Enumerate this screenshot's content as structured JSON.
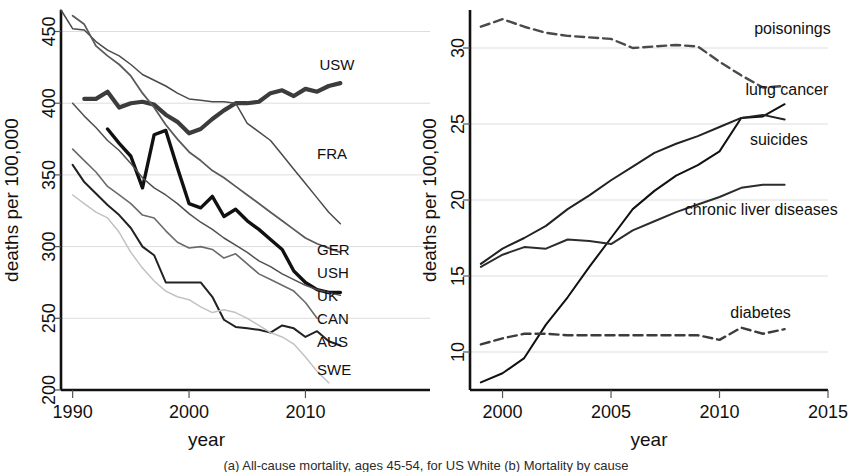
{
  "figure": {
    "caption_partial": "(a) All-cause mortality, ages 45-54, for US White (b) Mortality by cause"
  },
  "chart_data": [
    {
      "id": "left",
      "type": "line",
      "title": "",
      "xlabel": "year",
      "ylabel": "deaths per 100,000",
      "xlim": [
        1989,
        2014
      ],
      "ylim": [
        200,
        465
      ],
      "xticks": [
        1990,
        2000,
        2010
      ],
      "yticks": [
        200,
        250,
        300,
        350,
        400,
        450
      ],
      "grid": true,
      "legend_position": "right-inline",
      "series": [
        {
          "name": "USW",
          "label": "USW",
          "style": "solid",
          "weight": 4.2,
          "color": "#3c3c3c",
          "label_x": 2011.2,
          "label_y": 427,
          "x": [
            1991,
            1992,
            1993,
            1994,
            1995,
            1996,
            1997,
            1998,
            1999,
            2000,
            2001,
            2002,
            2003,
            2004,
            2005,
            2006,
            2007,
            2008,
            2009,
            2010,
            2011,
            2012,
            2013
          ],
          "y": [
            403,
            403,
            408,
            397,
            400,
            401,
            399,
            392,
            387,
            379,
            382,
            389,
            395,
            400,
            400,
            401,
            407,
            409,
            405,
            410,
            408,
            412,
            414
          ]
        },
        {
          "name": "FRA",
          "label": "FRA",
          "style": "solid",
          "weight": 1.5,
          "color": "#4a4a4a",
          "label_x": 2011.0,
          "label_y": 365,
          "x": [
            1989,
            1990,
            1991,
            1992,
            1993,
            1994,
            1995,
            1996,
            1997,
            1998,
            1999,
            2000,
            2001,
            2002,
            2003,
            2004,
            2005,
            2006,
            2007,
            2008,
            2009,
            2010,
            2011,
            2012,
            2013
          ],
          "y": [
            465,
            452,
            451,
            443,
            437,
            433,
            427,
            420,
            416,
            412,
            407,
            403,
            402,
            401,
            401,
            400,
            386,
            380,
            374,
            364,
            354,
            344,
            334,
            324,
            316
          ]
        },
        {
          "name": "GER",
          "label": "GER",
          "style": "solid",
          "weight": 1.8,
          "color": "#5a5a5a",
          "label_x": 2011.0,
          "label_y": 298,
          "x": [
            1990,
            1991,
            1992,
            1993,
            1994,
            1995,
            1996,
            1997,
            1998,
            1999,
            2000,
            2001,
            2002,
            2003,
            2004,
            2005,
            2006,
            2007,
            2008,
            2009,
            2010,
            2011,
            2012,
            2013
          ],
          "y": [
            461,
            455,
            440,
            433,
            427,
            419,
            407,
            397,
            385,
            375,
            366,
            360,
            353,
            348,
            342,
            336,
            330,
            324,
            318,
            312,
            306,
            302,
            299,
            296
          ]
        },
        {
          "name": "USH",
          "label": "USH",
          "style": "solid",
          "weight": 3.4,
          "color": "#111111",
          "label_x": 2011.0,
          "label_y": 282,
          "x": [
            1993,
            1994,
            1995,
            1996,
            1997,
            1998,
            1999,
            2000,
            2001,
            2002,
            2003,
            2004,
            2005,
            2006,
            2007,
            2008,
            2009,
            2010,
            2011,
            2012,
            2013
          ],
          "y": [
            382,
            372,
            363,
            341,
            378,
            381,
            355,
            330,
            327,
            335,
            321,
            326,
            318,
            312,
            305,
            298,
            283,
            275,
            270,
            268,
            268
          ]
        },
        {
          "name": "UK",
          "label": "UK",
          "style": "solid",
          "weight": 1.5,
          "color": "#4f4f4f",
          "label_x": 2011.0,
          "label_y": 266,
          "x": [
            1990,
            1991,
            1992,
            1993,
            1994,
            1995,
            1996,
            1997,
            1998,
            1999,
            2000,
            2001,
            2002,
            2003,
            2004,
            2005,
            2006,
            2007,
            2008,
            2009,
            2010,
            2011,
            2012,
            2013
          ],
          "y": [
            400,
            391,
            383,
            374,
            367,
            358,
            348,
            341,
            336,
            330,
            323,
            317,
            312,
            306,
            301,
            296,
            290,
            286,
            281,
            277,
            273,
            270,
            268,
            266
          ]
        },
        {
          "name": "CAN",
          "label": "CAN",
          "style": "solid",
          "weight": 1.6,
          "color": "#6a6a6a",
          "label_x": 2011.0,
          "label_y": 250,
          "x": [
            1990,
            1991,
            1992,
            1993,
            1994,
            1995,
            1996,
            1997,
            1998,
            1999,
            2000,
            2001,
            2002,
            2003,
            2004,
            2005,
            2006,
            2007,
            2008,
            2009,
            2010,
            2011
          ],
          "y": [
            368,
            360,
            352,
            342,
            336,
            330,
            322,
            320,
            311,
            303,
            299,
            300,
            298,
            292,
            295,
            288,
            281,
            277,
            273,
            269,
            261,
            250
          ]
        },
        {
          "name": "AUS",
          "label": "AUS",
          "style": "solid",
          "weight": 2.0,
          "color": "#222222",
          "label_x": 2011.0,
          "label_y": 234,
          "x": [
            1990,
            1991,
            1992,
            1993,
            1994,
            1995,
            1996,
            1997,
            1998,
            1999,
            2000,
            2001,
            2002,
            2003,
            2004,
            2005,
            2006,
            2007,
            2008,
            2009,
            2010,
            2011,
            2012,
            2013
          ],
          "y": [
            357,
            345,
            337,
            329,
            322,
            313,
            300,
            294,
            275,
            275,
            275,
            275,
            265,
            249,
            244,
            243,
            242,
            240,
            245,
            243,
            237,
            241,
            234,
            231
          ]
        },
        {
          "name": "SWE",
          "label": "SWE",
          "style": "solid",
          "weight": 1.5,
          "color": "#c2c2c2",
          "label_x": 2011.0,
          "label_y": 214,
          "x": [
            1990,
            1991,
            1992,
            1993,
            1994,
            1995,
            1996,
            1997,
            1998,
            1999,
            2000,
            2001,
            2002,
            2003,
            2004,
            2005,
            2006,
            2007,
            2008,
            2009,
            2010,
            2011,
            2012
          ],
          "y": [
            336,
            330,
            324,
            320,
            310,
            296,
            285,
            276,
            269,
            265,
            263,
            258,
            254,
            256,
            254,
            250,
            245,
            240,
            237,
            232,
            223,
            213,
            205
          ]
        }
      ]
    },
    {
      "id": "right",
      "type": "line",
      "title": "",
      "xlabel": "year",
      "ylabel": "deaths per 100,000",
      "xlim": [
        1998.5,
        2015
      ],
      "ylim": [
        7.5,
        32.5
      ],
      "xticks": [
        2000,
        2005,
        2010,
        2015
      ],
      "yticks": [
        10,
        15,
        20,
        25,
        30
      ],
      "grid": true,
      "legend_position": "right-inline",
      "series": [
        {
          "name": "poisonings",
          "label": "poisonings",
          "style": "solid",
          "weight": 2.0,
          "color": "#111111",
          "label_x": 2011.6,
          "label_y": 31.3,
          "x": [
            1999,
            2000,
            2001,
            2002,
            2003,
            2004,
            2005,
            2006,
            2007,
            2008,
            2009,
            2010,
            2011,
            2012,
            2013
          ],
          "y": [
            8.0,
            8.6,
            9.6,
            11.8,
            13.6,
            15.6,
            17.5,
            19.4,
            20.6,
            21.6,
            22.3,
            23.2,
            25.4,
            25.5,
            26.3
          ]
        },
        {
          "name": "lung cancer",
          "label": "lung cancer",
          "style": "dashed",
          "weight": 2.4,
          "color": "#4a4a4a",
          "label_x": 2011.2,
          "label_y": 27.3,
          "x": [
            1999,
            2000,
            2001,
            2002,
            2003,
            2004,
            2005,
            2006,
            2007,
            2008,
            2009,
            2010,
            2011,
            2012,
            2013
          ],
          "y": [
            31.4,
            31.9,
            31.4,
            31.0,
            30.8,
            30.7,
            30.6,
            30.0,
            30.1,
            30.2,
            30.1,
            29.1,
            28.2,
            27.4,
            27.5
          ]
        },
        {
          "name": "suicides",
          "label": "suicides",
          "style": "solid",
          "weight": 2.0,
          "color": "#222222",
          "label_x": 2011.4,
          "label_y": 24.0,
          "x": [
            1999,
            2000,
            2001,
            2002,
            2003,
            2004,
            2005,
            2006,
            2007,
            2008,
            2009,
            2010,
            2011,
            2012,
            2013
          ],
          "y": [
            15.8,
            16.8,
            17.5,
            18.3,
            19.4,
            20.3,
            21.3,
            22.2,
            23.1,
            23.7,
            24.2,
            24.8,
            25.4,
            25.6,
            25.3
          ]
        },
        {
          "name": "chronic liver diseases",
          "label": "chronic liver diseases",
          "style": "solid",
          "weight": 2.0,
          "color": "#2c2c2c",
          "label_x": 2008.4,
          "label_y": 19.4,
          "x": [
            1999,
            2000,
            2001,
            2002,
            2003,
            2004,
            2005,
            2006,
            2007,
            2008,
            2009,
            2010,
            2011,
            2012,
            2013
          ],
          "y": [
            15.6,
            16.4,
            16.9,
            16.8,
            17.4,
            17.3,
            17.1,
            18.0,
            18.6,
            19.2,
            19.7,
            20.2,
            20.8,
            21.0,
            21.0
          ]
        },
        {
          "name": "diabetes",
          "label": "diabetes",
          "style": "dashed",
          "weight": 2.4,
          "color": "#3c3c3c",
          "label_x": 2010.5,
          "label_y": 12.6,
          "x": [
            1999,
            2000,
            2001,
            2002,
            2003,
            2004,
            2005,
            2006,
            2007,
            2008,
            2009,
            2010,
            2011,
            2012,
            2013
          ],
          "y": [
            10.5,
            10.9,
            11.2,
            11.2,
            11.1,
            11.1,
            11.1,
            11.1,
            11.1,
            11.1,
            11.1,
            10.8,
            11.6,
            11.2,
            11.5
          ]
        }
      ]
    }
  ]
}
